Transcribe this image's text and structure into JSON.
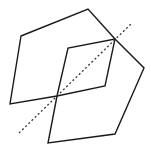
{
  "figure": {
    "width": 151,
    "height": 150,
    "background": "#ffffff",
    "stroke_color": "#1a1a1a",
    "stroke_width": 1.4,
    "polygons": [
      {
        "name": "upper-hexagon",
        "points": [
          [
            21,
            36
          ],
          [
            88,
            9
          ],
          [
            115,
            39
          ],
          [
            105,
            86
          ],
          [
            57,
            96
          ],
          [
            10,
            104
          ]
        ]
      },
      {
        "name": "lower-hexagon",
        "points": [
          [
            115,
            39
          ],
          [
            144,
            68
          ],
          [
            115,
            134
          ],
          [
            48,
            143
          ],
          [
            57,
            96
          ],
          [
            68,
            48
          ]
        ]
      }
    ],
    "symmetry_axis": {
      "name": "dotted-line-of-reflection",
      "from": [
        19,
        133
      ],
      "to": [
        132,
        23
      ],
      "color": "#333333",
      "stroke_width": 1.3,
      "dash": "2 2.4"
    }
  }
}
